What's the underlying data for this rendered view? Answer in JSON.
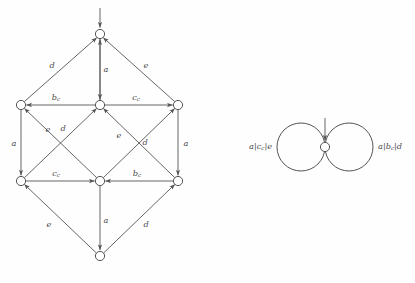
{
  "figure": {
    "title": "",
    "background_color": "#fefefe",
    "stroke_color": "#555555",
    "label_color": "#4a4a4a",
    "node_fill": "#ffffff"
  },
  "left_automaton": {
    "name": "unfolded-state-diagram",
    "node_radius": 4.6,
    "nodes": [
      {
        "id": "n-top",
        "label": "",
        "x": 100,
        "y": 34,
        "initial": true
      },
      {
        "id": "n-mid-left",
        "label": "",
        "x": 21,
        "y": 105,
        "initial": false
      },
      {
        "id": "n-mid-center",
        "label": "",
        "x": 100,
        "y": 105,
        "initial": false
      },
      {
        "id": "n-mid-right",
        "label": "",
        "x": 178,
        "y": 105,
        "initial": false
      },
      {
        "id": "n-low-left",
        "label": "",
        "x": 21,
        "y": 181,
        "initial": false
      },
      {
        "id": "n-low-center",
        "label": "",
        "x": 100,
        "y": 181,
        "initial": false
      },
      {
        "id": "n-low-right",
        "label": "",
        "x": 178,
        "y": 181,
        "initial": false
      },
      {
        "id": "n-bottom",
        "label": "",
        "x": 100,
        "y": 256,
        "initial": false
      }
    ],
    "initial_arrow": {
      "from_x": 100,
      "from_y": 8,
      "to_x": 100,
      "to_y": 28
    },
    "edges": [
      {
        "id": "e-midleft-top",
        "from": "n-mid-left",
        "to": "n-top",
        "label": "d",
        "sub": "",
        "label_x": 52,
        "label_y": 66
      },
      {
        "id": "e-midcenter-top",
        "from": "n-mid-center",
        "to": "n-top",
        "label": "a",
        "sub": "",
        "label_x": 106,
        "label_y": 70
      },
      {
        "id": "e-midright-top",
        "from": "n-mid-right",
        "to": "n-top",
        "label": "e",
        "sub": "",
        "label_x": 146,
        "label_y": 66
      },
      {
        "id": "e-top-midcenter",
        "from": "n-top",
        "to": "n-mid-center",
        "label": "",
        "sub": "",
        "label_x": 0,
        "label_y": 0
      },
      {
        "id": "e-midcenter-midleft",
        "from": "n-mid-center",
        "to": "n-mid-left",
        "label": "b",
        "sub": "c",
        "label_x": 56,
        "label_y": 98
      },
      {
        "id": "e-midcenter-midright",
        "from": "n-mid-center",
        "to": "n-mid-right",
        "label": "c",
        "sub": "c",
        "label_x": 136,
        "label_y": 98
      },
      {
        "id": "e-midleft-lowleft",
        "from": "n-mid-left",
        "to": "n-low-left",
        "label": "a",
        "sub": "",
        "label_x": 14,
        "label_y": 144
      },
      {
        "id": "e-midright-lowright",
        "from": "n-mid-right",
        "to": "n-low-right",
        "label": "a",
        "sub": "",
        "label_x": 186,
        "label_y": 144
      },
      {
        "id": "e-lowcenter-midleft",
        "from": "n-low-center",
        "to": "n-mid-left",
        "label": "e",
        "sub": "",
        "label_x": 48,
        "label_y": 130
      },
      {
        "id": "e-lowleft-midcenter",
        "from": "n-low-left",
        "to": "n-mid-center",
        "label": "d",
        "sub": "",
        "label_x": 63,
        "label_y": 129
      },
      {
        "id": "e-lowcenter-midright",
        "from": "n-low-center",
        "to": "n-mid-right",
        "label": "e",
        "sub": "",
        "label_x": 119,
        "label_y": 136
      },
      {
        "id": "e-lowright-midcenter",
        "from": "n-low-right",
        "to": "n-mid-center",
        "label": "d",
        "sub": "",
        "label_x": 145,
        "label_y": 143
      },
      {
        "id": "e-lowleft-lowcenter",
        "from": "n-low-left",
        "to": "n-low-center",
        "label": "c",
        "sub": "c",
        "label_x": 56,
        "label_y": 174
      },
      {
        "id": "e-lowright-lowcenter",
        "from": "n-low-right",
        "to": "n-low-center",
        "label": "b",
        "sub": "c",
        "label_x": 137,
        "label_y": 174
      },
      {
        "id": "e-bottom-lowleft",
        "from": "n-bottom",
        "to": "n-low-left",
        "label": "e",
        "sub": "",
        "label_x": 49,
        "label_y": 225
      },
      {
        "id": "e-lowcenter-bottom",
        "from": "n-low-center",
        "to": "n-bottom",
        "label": "a",
        "sub": "",
        "label_x": 106,
        "label_y": 221
      },
      {
        "id": "e-bottom-lowright",
        "from": "n-bottom",
        "to": "n-low-right",
        "label": "d",
        "sub": "",
        "label_x": 146,
        "label_y": 225
      }
    ]
  },
  "right_automaton": {
    "name": "folded-state-diagram",
    "node": {
      "id": "n-single",
      "label": "",
      "x": 325,
      "y": 147,
      "radius": 4.6,
      "initial": true
    },
    "initial_arrow": {
      "from_x": 325,
      "from_y": 118,
      "to_x": 325,
      "to_y": 141
    },
    "loops": [
      {
        "id": "loop-left",
        "side": "left",
        "center_x": 301,
        "center_y": 147,
        "radius": 24,
        "label_parts": [
          "a",
          "|",
          "c",
          "c",
          "|",
          "e"
        ],
        "label_text": "a|c_c|e",
        "label_x": 272,
        "label_y": 147
      },
      {
        "id": "loop-right",
        "side": "right",
        "center_x": 349,
        "center_y": 147,
        "radius": 24,
        "label_parts": [
          "a",
          "|",
          "b",
          "c",
          "|",
          "d"
        ],
        "label_text": "a|b_c|d",
        "label_x": 378,
        "label_y": 147
      }
    ]
  }
}
